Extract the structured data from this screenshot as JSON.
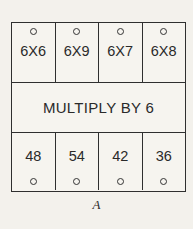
{
  "figure": {
    "caption": "A",
    "banner_label": "MULTIPLY BY 6",
    "colors": {
      "page_background": "#f3f1ec",
      "box_background": "#f6f4ef",
      "border": "#2f2f2f",
      "text": "#2a2a2a"
    },
    "inputs": [
      {
        "connector": "circle-connector",
        "expression": "6X6"
      },
      {
        "connector": "circle-connector",
        "expression": "6X9"
      },
      {
        "connector": "circle-connector",
        "expression": "6X7"
      },
      {
        "connector": "circle-connector",
        "expression": "6X8"
      }
    ],
    "outputs": [
      {
        "answer": "48",
        "connector": "circle-connector"
      },
      {
        "answer": "54",
        "connector": "circle-connector"
      },
      {
        "answer": "42",
        "connector": "circle-connector"
      },
      {
        "answer": "36",
        "connector": "circle-connector"
      }
    ]
  }
}
